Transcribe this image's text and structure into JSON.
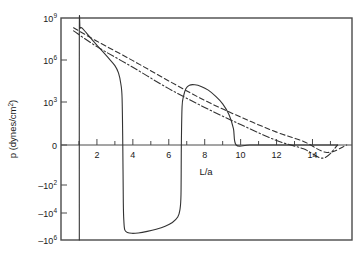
{
  "chart_data": {
    "type": "line",
    "title": "",
    "xlabel": "L/a",
    "ylabel": "p (dynes/cm",
    "ylabel_sup": "2",
    "ylabel_tail": ")",
    "xlim": [
      0,
      16.2
    ],
    "ylim_symlog_decades": [
      "10^9",
      "10^6",
      "10^3",
      "0",
      "-10^2",
      "-10^4",
      "-10^6"
    ],
    "grid": false,
    "legend": "none",
    "x_major_ticks": [
      2,
      4,
      6,
      8,
      10,
      12,
      14
    ],
    "x_major_tick_labels": [
      "2",
      "4",
      "6",
      "8",
      "10",
      "12",
      "14"
    ],
    "x_minor_ticks": [
      1,
      3,
      5,
      7,
      9,
      11,
      13,
      15
    ],
    "y_tick_labels": [
      {
        "mantissa": "10",
        "exp": "9",
        "neg": false
      },
      {
        "mantissa": "10",
        "exp": "6",
        "neg": false
      },
      {
        "mantissa": "10",
        "exp": "3",
        "neg": false
      },
      {
        "mantissa": "0",
        "exp": "",
        "neg": false
      },
      {
        "mantissa": "10",
        "exp": "2",
        "neg": true
      },
      {
        "mantissa": "10",
        "exp": "4",
        "neg": true
      },
      {
        "mantissa": "10",
        "exp": "6",
        "neg": true
      }
    ],
    "series": [
      {
        "name": "pressure-curve",
        "style": "solid",
        "color": "#333333",
        "points": [
          [
            1.02,
            -1000000.0
          ],
          [
            1.02,
            100000000.0
          ],
          [
            1.06,
            180000000.0
          ],
          [
            1.15,
            200000000.0
          ],
          [
            1.4,
            90000000.0
          ],
          [
            1.8,
            22000000.0
          ],
          [
            2.2,
            6000000.0
          ],
          [
            2.6,
            1600000.0
          ],
          [
            3.0,
            400000.0
          ],
          [
            3.2,
            120000.0
          ],
          [
            3.33,
            20000.0
          ],
          [
            3.4,
            2000.0
          ],
          [
            3.44,
            0.0
          ],
          [
            3.47,
            -2000.0
          ],
          [
            3.5,
            -40000.0
          ],
          [
            3.55,
            -180000.0
          ],
          [
            3.7,
            -280000.0
          ],
          [
            3.95,
            -320000.0
          ],
          [
            4.3,
            -300000.0
          ],
          [
            4.8,
            -230000.0
          ],
          [
            5.3,
            -160000.0
          ],
          [
            5.8,
            -95000.0
          ],
          [
            6.2,
            -50000.0
          ],
          [
            6.5,
            -20000.0
          ],
          [
            6.62,
            -6000.0
          ],
          [
            6.68,
            -500.0
          ],
          [
            6.7,
            0.0
          ],
          [
            6.74,
            400.0
          ],
          [
            6.82,
            2500.0
          ],
          [
            6.95,
            9000.0
          ],
          [
            7.15,
            16000.0
          ],
          [
            7.45,
            17000.0
          ],
          [
            7.8,
            13000.0
          ],
          [
            8.2,
            7000.0
          ],
          [
            8.6,
            2600.0
          ],
          [
            9.0,
            700.0
          ],
          [
            9.35,
            90.0
          ],
          [
            9.6,
            6.0
          ],
          [
            9.75,
            0.0
          ],
          [
            10.5,
            0.0
          ],
          [
            12.0,
            0.0
          ],
          [
            14.0,
            0.0
          ],
          [
            15.4,
            0.0
          ]
        ]
      },
      {
        "name": "asymptote-dash-dot",
        "style": "dash-dot",
        "color": "#333333",
        "points": [
          [
            0.7,
            120000000.0
          ],
          [
            2.0,
            9000000.0
          ],
          [
            4.0,
            300000.0
          ],
          [
            6.0,
            9000.0
          ],
          [
            8.0,
            350.0
          ],
          [
            10.0,
            13.0
          ],
          [
            12.0,
            0.6
          ],
          [
            13.5,
            0.12
          ],
          [
            14.6,
            0.02
          ],
          [
            15.4,
            0.0
          ]
        ]
      },
      {
        "name": "asymptote-dashed",
        "style": "dashed",
        "color": "#333333",
        "points": [
          [
            0.7,
            200000000.0
          ],
          [
            2.0,
            22000000.0
          ],
          [
            4.0,
            900000.0
          ],
          [
            6.0,
            32000.0
          ],
          [
            8.0,
            1300.0
          ],
          [
            10.0,
            55.0
          ],
          [
            12.0,
            3.0
          ],
          [
            13.5,
            0.5
          ],
          [
            14.8,
            0.06
          ],
          [
            15.9,
            0.0
          ]
        ]
      }
    ],
    "zero_line": true
  }
}
